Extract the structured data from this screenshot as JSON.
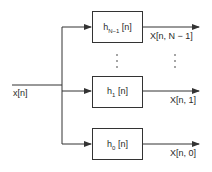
{
  "diagram": {
    "input_label": "x[n]",
    "filters": [
      {
        "name": "h",
        "subscript": "N−1",
        "arg": "[n]",
        "output_label": "X[n, N − 1]"
      },
      {
        "name": "h",
        "subscript": "1",
        "arg": "[n]",
        "output_label": "X[n, 1]"
      },
      {
        "name": "h",
        "subscript": "0",
        "arg": "[n]",
        "output_label": "X[n, 0]"
      }
    ],
    "ellipsis": "⋮",
    "colors": {
      "line": "#333333",
      "background": "#ffffff"
    }
  }
}
